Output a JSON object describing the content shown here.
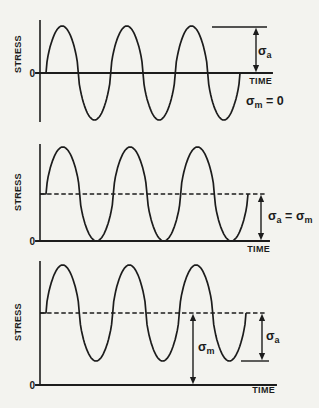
{
  "labels": {
    "stress_axis": "STRESS",
    "time_axis": "TIME",
    "origin_zero": "0",
    "sigma": "σ",
    "sub_a": "a",
    "sub_m": "m",
    "equals": "=",
    "equals_zero": "= 0"
  },
  "colors": {
    "ink": "#1c1c1c",
    "background": "#f3f3ef"
  },
  "chart_data": [
    {
      "type": "line",
      "panel": "reversed-stress-cycle",
      "xlabel": "TIME",
      "ylabel": "STRESS",
      "waveform": "sinusoid",
      "cycles": 3,
      "mean_stress": 0,
      "stress_amplitude": 1,
      "max_stress": 1,
      "min_stress": -1,
      "zero_line_marked": true,
      "annotations": [
        "σa measured from zero line up to peak reference line",
        "σm = 0"
      ]
    },
    {
      "type": "line",
      "panel": "repeated-stress-cycle-sigma-a-equals-sigma-m",
      "xlabel": "TIME",
      "ylabel": "STRESS",
      "waveform": "sinusoid",
      "cycles": 3,
      "mean_stress": 1,
      "stress_amplitude": 1,
      "max_stress": 2,
      "min_stress": 0,
      "mean_shown_as_dashed_line": true,
      "annotations": [
        "σa = σm measured from time axis up to dashed mean line"
      ]
    },
    {
      "type": "line",
      "panel": "fluctuating-stress-cycle",
      "xlabel": "TIME",
      "ylabel": "STRESS",
      "waveform": "sinusoid",
      "cycles": 3,
      "mean_stress": 1.5,
      "stress_amplitude": 1,
      "max_stress": 2.5,
      "min_stress": 0.5,
      "mean_shown_as_dashed_line": true,
      "annotations": [
        "σm measured from time axis up to dashed mean line",
        "σa measured from dashed mean line down to minimum reference line"
      ]
    }
  ]
}
